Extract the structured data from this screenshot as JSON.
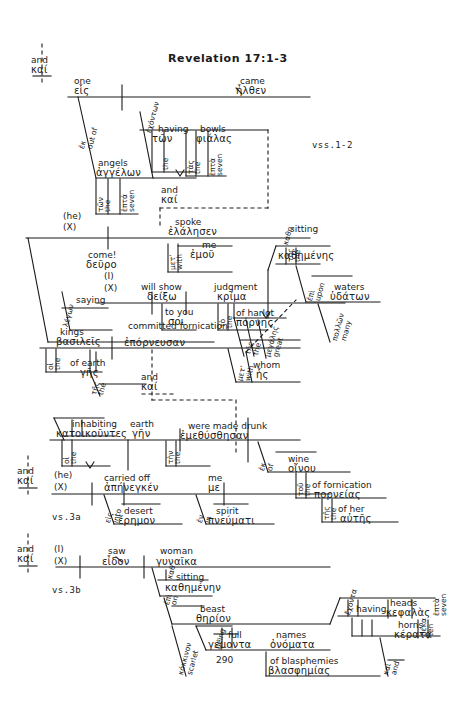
{
  "page": {
    "title": "Revelation 17:1-3",
    "page_number": "290",
    "verse_markers": [
      "vss.1-2",
      "vs.3a",
      "vs.3b"
    ],
    "background_color": "#ffffff",
    "ink_color": "#1a1a1a",
    "diagram_type": "greek-sentence-diagram"
  },
  "conjunctions": [
    {
      "english": "and",
      "greek": "καί"
    },
    {
      "english": "and",
      "greek": "καί"
    },
    {
      "english": "and",
      "greek": "καί"
    },
    {
      "english": "and",
      "greek": "καί"
    },
    {
      "english": "and",
      "greek": "καί"
    }
  ],
  "clause1": {
    "subject_eng": "one",
    "subject_gk": "εἷς",
    "verb_eng": "came",
    "verb_gk": "ἦλθεν",
    "prep_eng": "out of",
    "prep_gk": "ἐκ",
    "obj_eng": "angels",
    "obj_gk": "ἀγγέλων",
    "art_eng": "the",
    "art_gk": "τῶν",
    "num_eng": "seven",
    "num_gk": "ἑπτά",
    "ptc_eng": "having",
    "ptc_gk": "ἐχόντων",
    "ptc_art_eng": "the",
    "ptc_art_gk": "τῶν",
    "bowls_eng": "bowls",
    "bowls_gk": "φιάλας",
    "bowls_art_eng": "the",
    "bowls_art_gk": "τὰς",
    "bowls_num_eng": "seven",
    "bowls_num_gk": "ἑπτὰ"
  },
  "clause2": {
    "subject_eng": "(he)",
    "subject_x": "(X)",
    "verb_eng": "spoke",
    "verb_gk": "ἐλάλησεν",
    "prep_eng": "with",
    "prep_gk": "μετ’",
    "pron_eng": "me",
    "pron_gk": "ἐμοῦ",
    "ptc_eng": "saying",
    "ptc_gk": "λέγων",
    "cmd_eng": "come!",
    "cmd_gk": "δεῦρο"
  },
  "clause3": {
    "subject_eng": "(I)",
    "subject_x": "(X)",
    "verb_eng": "will show",
    "verb_gk": "δείξω",
    "iobj_eng": "to you",
    "iobj_gk": "σοι",
    "dobj_eng": "judgment",
    "dobj_gk": "κρίμα",
    "dobj_art_eng": "the",
    "dobj_art_gk": "τὸ",
    "gen_eng": "of harlot",
    "gen_gk": "πόρνης",
    "gen_art_eng": "the",
    "gen_art_gk": "τῆς",
    "gen_adj_eng": "great",
    "gen_adj_gk": "μεγάλης",
    "ptc_eng": "sitting",
    "ptc_gk": "καθημένης",
    "ptc_art_eng": "the",
    "ptc_art_gk": "τῆς",
    "prep_eng": "upon",
    "prep_gk": "ἐπὶ",
    "waters_eng": "waters",
    "waters_gk": "ὑδάτων",
    "waters_adj_eng": "many",
    "waters_adj_gk": "πολλῶν"
  },
  "clause4": {
    "subject_eng": "kings",
    "subject_gk": "βασιλεῖς",
    "subject_art_eng": "the",
    "subject_art_gk": "οἱ",
    "gen_eng": "of earth",
    "gen_gk": "γῆς",
    "gen_art_eng": "the",
    "gen_art_gk": "τῆς",
    "verb_eng": "committed fornication",
    "verb_gk": "ἐπόρνευσαν",
    "prep_eng": "with",
    "prep_gk": "μετ’",
    "rel_eng": "whom",
    "rel_gk": "ἧς"
  },
  "clause5": {
    "subject_eng": "inhabiting",
    "subject_gk": "κατοικοῦντες",
    "subject_art_eng": "the",
    "subject_art_gk": "οἱ",
    "obj_eng": "earth",
    "obj_gk": "γῆν",
    "obj_art_eng": "the",
    "obj_art_gk": "τὴν",
    "verb_eng": "were made drunk",
    "verb_gk": "ἐμεθύσθησαν",
    "prep_eng": "of",
    "prep_gk": "ἐκ",
    "wine_eng": "wine",
    "wine_gk": "οἴνου",
    "wine_art_eng": "the",
    "wine_art_gk": "τοῦ",
    "gen_eng": "of fornication",
    "gen_gk": "πορνείας",
    "gen_art_eng": "the",
    "gen_art_gk": "τῆς",
    "poss_eng": "of her",
    "poss_gk": "αὐτῆς"
  },
  "clause6": {
    "subject_eng": "(he)",
    "subject_x": "(X)",
    "verb_eng": "carried off",
    "verb_gk": "ἀπήνεγκέν",
    "obj_eng": "me",
    "obj_gk": "με",
    "prep_eng": "into",
    "prep_gk": "εἰς",
    "place_eng": "desert",
    "place_gk": "ἔρημον",
    "prep2_eng": "in",
    "prep2_gk": "ἐν",
    "means_eng": "spirit",
    "means_gk": "πνεύματι"
  },
  "clause7": {
    "subject_eng": "(I)",
    "subject_x": "(X)",
    "verb_eng": "saw",
    "verb_gk": "εἶδον",
    "obj_eng": "woman",
    "obj_gk": "γυναῖκα",
    "ptc_eng": "sitting",
    "ptc_gk": "καθημένην",
    "prep_eng": "on",
    "prep_gk": "ἐπὶ",
    "beast_eng": "beast",
    "beast_gk": "θηρίον",
    "beast_adj_eng": "scarlet",
    "beast_adj_gk": "κόκκινον",
    "full_eng": "full",
    "full_gk": "γέμοντα",
    "full_pre_eng": "being",
    "names_eng": "names",
    "names_gk": "ὀνόματα",
    "blasph_eng": "of blasphemies",
    "blasph_gk": "βλασφημίας",
    "having_eng": "having",
    "having_gk": "ἔχοντα",
    "heads_eng": "heads",
    "heads_gk": "κεφαλὰς",
    "heads_num_eng": "seven",
    "heads_num_gk": "ἑπτὰ",
    "horns_eng": "horns",
    "horns_gk": "κέρατα",
    "horns_num_eng": "ten",
    "horns_num_gk": "δέκα",
    "horns_conj_eng": "and",
    "horns_conj_gk": "καὶ"
  }
}
